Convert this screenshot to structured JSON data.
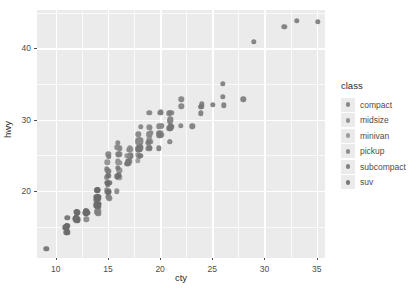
{
  "chart_data": {
    "type": "scatter",
    "title": "",
    "xlabel": "cty",
    "ylabel": "hwy",
    "xlim": [
      8.2,
      35.8
    ],
    "ylim": [
      10.6,
      45.4
    ],
    "xticks": [
      10,
      15,
      20,
      25,
      30,
      35
    ],
    "yticks": [
      20,
      30,
      40
    ],
    "x_minor_ticks": [
      12.5,
      17.5,
      22.5,
      27.5,
      32.5
    ],
    "y_minor_ticks": [
      15,
      25,
      35,
      45
    ],
    "grid": true,
    "legend_position": "right",
    "legend_title": "class",
    "legend_entries": [
      {
        "label": "compact",
        "color": "#7d7d7d"
      },
      {
        "label": "midsize",
        "color": "#8a8a8a"
      },
      {
        "label": "minivan",
        "color": "#959595"
      },
      {
        "label": "pickup",
        "color": "#828282"
      },
      {
        "label": "subcompact",
        "color": "#767676"
      },
      {
        "label": "suv",
        "color": "#6b6b6b"
      }
    ],
    "series": [
      {
        "name": "compact",
        "color": "#7d7d7d",
        "points": [
          [
            18,
            29
          ],
          [
            21,
            29
          ],
          [
            20,
            31
          ],
          [
            21,
            30
          ],
          [
            16,
            26
          ],
          [
            18,
            26
          ],
          [
            18,
            27
          ],
          [
            18,
            26
          ],
          [
            16,
            25
          ],
          [
            20,
            28
          ],
          [
            19,
            27
          ],
          [
            15,
            25
          ],
          [
            17,
            25
          ],
          [
            17,
            25
          ],
          [
            15,
            25
          ],
          [
            17,
            24
          ],
          [
            16,
            25
          ],
          [
            18,
            27
          ],
          [
            21,
            30
          ],
          [
            20,
            29
          ],
          [
            20,
            31
          ],
          [
            21,
            31
          ],
          [
            19,
            31
          ],
          [
            22,
            29
          ],
          [
            21,
            31
          ],
          [
            21,
            30
          ],
          [
            22,
            33
          ],
          [
            22,
            32
          ],
          [
            24,
            32
          ],
          [
            18,
            27
          ],
          [
            18,
            26
          ],
          [
            20,
            28
          ],
          [
            21,
            29
          ],
          [
            21,
            31
          ],
          [
            19,
            28
          ],
          [
            18,
            26
          ],
          [
            19,
            27
          ],
          [
            19,
            26
          ],
          [
            20,
            29
          ],
          [
            20,
            28
          ],
          [
            17,
            26
          ],
          [
            16,
            26
          ],
          [
            17,
            25
          ],
          [
            18,
            28
          ],
          [
            21,
            29
          ],
          [
            16,
            27
          ],
          [
            18,
            26
          ]
        ]
      },
      {
        "name": "midsize",
        "color": "#8a8a8a",
        "points": [
          [
            18,
            26
          ],
          [
            18,
            25
          ],
          [
            16,
            24
          ],
          [
            18,
            27
          ],
          [
            18,
            25
          ],
          [
            19,
            28
          ],
          [
            19,
            27
          ],
          [
            17,
            24
          ],
          [
            19,
            27
          ],
          [
            21,
            29
          ],
          [
            16,
            26
          ],
          [
            18,
            26
          ],
          [
            18,
            26
          ],
          [
            18,
            27
          ],
          [
            16,
            23
          ],
          [
            16,
            24
          ],
          [
            15,
            24
          ],
          [
            18,
            26
          ],
          [
            18,
            27
          ],
          [
            19,
            26
          ],
          [
            19,
            28
          ],
          [
            17,
            26
          ],
          [
            18,
            26
          ],
          [
            17,
            25
          ],
          [
            21,
            27
          ],
          [
            19,
            28
          ],
          [
            18,
            27
          ],
          [
            18,
            26
          ],
          [
            19,
            29
          ],
          [
            21,
            27
          ],
          [
            18,
            25
          ],
          [
            20,
            28
          ],
          [
            19,
            29
          ],
          [
            20,
            29
          ],
          [
            18,
            27
          ],
          [
            19,
            26
          ],
          [
            19,
            28
          ],
          [
            21,
            30
          ],
          [
            17,
            26
          ],
          [
            17,
            24
          ],
          [
            18,
            27
          ]
        ]
      },
      {
        "name": "minivan",
        "color": "#959595",
        "points": [
          [
            18,
            24
          ],
          [
            17,
            24
          ],
          [
            16,
            22
          ],
          [
            17,
            24
          ],
          [
            15,
            22
          ],
          [
            16,
            22
          ],
          [
            16,
            24
          ],
          [
            15,
            22
          ],
          [
            17,
            24
          ],
          [
            16,
            23
          ],
          [
            15,
            22
          ]
        ]
      },
      {
        "name": "pickup",
        "color": "#828282",
        "points": [
          [
            14,
            17
          ],
          [
            13,
            17
          ],
          [
            15,
            19
          ],
          [
            15,
            19
          ],
          [
            13,
            17
          ],
          [
            14,
            17
          ],
          [
            15,
            20
          ],
          [
            14,
            17
          ],
          [
            14,
            17
          ],
          [
            12,
            16
          ],
          [
            12,
            16
          ],
          [
            15,
            20
          ],
          [
            14,
            18
          ],
          [
            13,
            17
          ],
          [
            12,
            17
          ],
          [
            12,
            17
          ],
          [
            16,
            20
          ],
          [
            14,
            19
          ],
          [
            15,
            20
          ],
          [
            11,
            15
          ],
          [
            12,
            16
          ],
          [
            14,
            18
          ],
          [
            15,
            19
          ],
          [
            14,
            18
          ],
          [
            14,
            17
          ],
          [
            15,
            20
          ],
          [
            12,
            17
          ],
          [
            11,
            15
          ],
          [
            13,
            17
          ],
          [
            14,
            17
          ],
          [
            13,
            17
          ],
          [
            13,
            16
          ],
          [
            11,
            15
          ]
        ]
      },
      {
        "name": "subcompact",
        "color": "#767676",
        "points": [
          [
            18,
            26
          ],
          [
            21,
            29
          ],
          [
            21,
            29
          ],
          [
            21,
            29
          ],
          [
            18,
            26
          ],
          [
            18,
            26
          ],
          [
            16,
            23
          ],
          [
            20,
            26
          ],
          [
            19,
            26
          ],
          [
            20,
            28
          ],
          [
            15,
            23
          ],
          [
            17,
            24
          ],
          [
            17,
            24
          ],
          [
            15,
            23
          ],
          [
            14,
            20
          ],
          [
            28,
            33
          ],
          [
            24,
            32
          ],
          [
            25,
            32
          ],
          [
            23,
            29
          ],
          [
            24,
            32
          ],
          [
            26,
            35
          ],
          [
            35,
            44
          ],
          [
            33,
            44
          ],
          [
            29,
            41
          ],
          [
            32,
            43
          ],
          [
            26,
            33
          ],
          [
            26,
            32
          ],
          [
            24,
            31
          ],
          [
            21,
            29
          ],
          [
            19,
            27
          ],
          [
            18,
            26
          ],
          [
            21,
            29
          ],
          [
            20,
            28
          ],
          [
            17,
            24
          ],
          [
            18,
            25
          ]
        ]
      },
      {
        "name": "suv",
        "color": "#6b6b6b",
        "points": [
          [
            14,
            19
          ],
          [
            14,
            19
          ],
          [
            14,
            18
          ],
          [
            13,
            17
          ],
          [
            11,
            15
          ],
          [
            12,
            17
          ],
          [
            14,
            19
          ],
          [
            15,
            21
          ],
          [
            14,
            18
          ],
          [
            14,
            20
          ],
          [
            12,
            16
          ],
          [
            11,
            14
          ],
          [
            14,
            19
          ],
          [
            14,
            19
          ],
          [
            12,
            17
          ],
          [
            15,
            20
          ],
          [
            14,
            18
          ],
          [
            13,
            17
          ],
          [
            14,
            20
          ],
          [
            15,
            22
          ],
          [
            16,
            22
          ],
          [
            15,
            21
          ],
          [
            12,
            16
          ],
          [
            14,
            18
          ],
          [
            13,
            17
          ],
          [
            12,
            16
          ],
          [
            11,
            16
          ],
          [
            11,
            15
          ],
          [
            11,
            15
          ],
          [
            11,
            14
          ],
          [
            12,
            16
          ],
          [
            14,
            18
          ],
          [
            14,
            19
          ],
          [
            12,
            16
          ],
          [
            13,
            17
          ],
          [
            14,
            19
          ],
          [
            15,
            21
          ],
          [
            16,
            22
          ],
          [
            14,
            20
          ],
          [
            13,
            17
          ],
          [
            14,
            18
          ],
          [
            12,
            16
          ],
          [
            12,
            16
          ],
          [
            11,
            15
          ],
          [
            11,
            15
          ],
          [
            12,
            17
          ],
          [
            14,
            18
          ],
          [
            13,
            17
          ],
          [
            15,
            21
          ],
          [
            14,
            20
          ],
          [
            12,
            16
          ],
          [
            13,
            17
          ],
          [
            11,
            15
          ],
          [
            9,
            12
          ],
          [
            12,
            17
          ],
          [
            12,
            16
          ],
          [
            11,
            15
          ],
          [
            14,
            19
          ],
          [
            13,
            17
          ],
          [
            11,
            14
          ],
          [
            12,
            16
          ],
          [
            14,
            19
          ]
        ]
      }
    ]
  }
}
